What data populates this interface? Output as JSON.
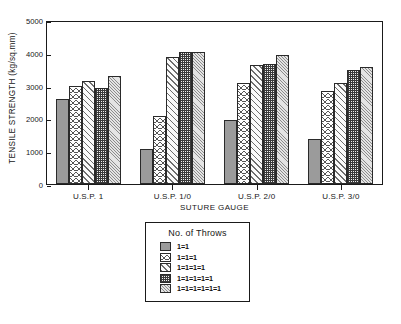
{
  "chart_data": {
    "type": "bar",
    "title": "",
    "xlabel": "SUTURE GAUGE",
    "ylabel": "TENSILE STRENGTH (kg/sq.mm)",
    "categories": [
      "U.S.P. 1",
      "U.S.P. 1/0",
      "U.S.P. 2/0",
      "U.S.P. 3/0"
    ],
    "ylim": [
      0,
      5000
    ],
    "yticks": [
      "0",
      "1000",
      "2000",
      "3000",
      "4000",
      "5000"
    ],
    "ytick_values": [
      0,
      1000,
      2000,
      3000,
      4000,
      5000
    ],
    "grid": false,
    "legend_title": "No. of Throws",
    "legend_position": "below-plot-center",
    "series": [
      {
        "name": "1=1",
        "values": [
          2580,
          1070,
          1960,
          1380
        ]
      },
      {
        "name": "1=1=1",
        "values": [
          2990,
          2080,
          3080,
          2850
        ]
      },
      {
        "name": "1=1=1=1",
        "values": [
          3150,
          3860,
          3640,
          3090
        ]
      },
      {
        "name": "1=1=1=1=1",
        "values": [
          2940,
          4040,
          3650,
          3490
        ]
      },
      {
        "name": "1=1=1=1=1=1",
        "values": [
          3290,
          4030,
          3940,
          3560
        ]
      }
    ],
    "series_patterns": [
      "solid-gray",
      "cross-hatch",
      "diagonal-hatch",
      "dense-checker",
      "fine-diagonal"
    ]
  },
  "axis": {
    "y_title": "TENSILE STRENGTH (kg/sq.mm)",
    "x_title": "SUTURE GAUGE"
  },
  "legend": {
    "title": "No. of Throws",
    "items": [
      {
        "label": "1=1"
      },
      {
        "label": "1=1=1"
      },
      {
        "label": "1=1=1=1"
      },
      {
        "label": "1=1=1=1=1"
      },
      {
        "label": "1=1=1=1=1=1"
      }
    ]
  }
}
